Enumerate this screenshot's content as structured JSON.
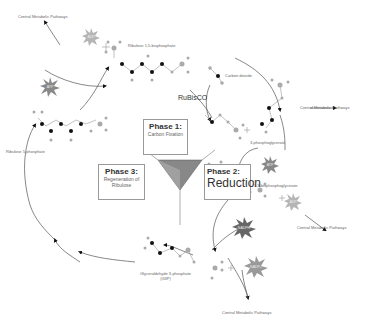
{
  "diagram": {
    "phases": [
      {
        "title": "Phase 1:",
        "subtitle": "Carbon Fixation"
      },
      {
        "title": "Phase 2:",
        "subtitle": "Reduction"
      },
      {
        "title": "Phase 3:",
        "subtitle": "Regeneration of Ribulose"
      }
    ],
    "enzyme": "RuBisCO",
    "molecules": {
      "rubp": "Ribulose 1,5-bisphosphate",
      "co2": "Carbon dioxide",
      "pga3": "3-phosphoglycerate",
      "bpg": "1,3-bisphosphoglycerate",
      "g3p": "Glyceraldehyde 3-phosphate (G3P)",
      "g3p_line1": "Glyceraldehyde 3-phosphate",
      "g3p_line2": "(G3P)",
      "ru5p": "Ribulose 5-phosphate"
    },
    "cofactors": {
      "adp_top": "ADP",
      "atp_left": "ATP",
      "atp_right": "ATP",
      "adp_right": "ADP",
      "nadph": "NADPH",
      "nadp": "NADP+"
    },
    "outputs": {
      "cmp_top_left": "Central Metabolic Pathways",
      "cmp_right_top": "Central Metabolic Pathways",
      "cmp_right_mid": "Central Metabolic Pathways",
      "cmp_bottom": "Central Metabolic Pathways"
    },
    "colors": {
      "star_light": "#b5b5b5",
      "star_dark": "#666666",
      "atom_black": "#111111",
      "atom_grey": "#aaaaaa",
      "triangle": "#888888"
    }
  }
}
